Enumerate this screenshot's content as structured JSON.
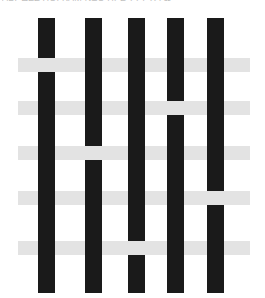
{
  "header": {
    "clipped_text": "ΑΒΓ ΔΕΖ ΗΘΙ ΚΛΜ ΝΞΟ ΠΡΣ ΤΥΦ ΧΨΩ"
  },
  "figure": {
    "background_color": "#ffffff",
    "warp_color": "#1a1a1a",
    "weft_color": "#e3e3e3",
    "warp_count": 5,
    "weft_count": 5,
    "warps": [
      {
        "id": "warp-1",
        "x": 38,
        "y": 18,
        "width": 17,
        "height": 275
      },
      {
        "id": "warp-2",
        "x": 85,
        "y": 18,
        "width": 17,
        "height": 275
      },
      {
        "id": "warp-3",
        "x": 128,
        "y": 18,
        "width": 17,
        "height": 275
      },
      {
        "id": "warp-4",
        "x": 167,
        "y": 18,
        "width": 17,
        "height": 275
      },
      {
        "id": "warp-5",
        "x": 207,
        "y": 18,
        "width": 17,
        "height": 275
      }
    ],
    "wefts": [
      {
        "id": "weft-1",
        "x": 18,
        "y": 58,
        "width": 232,
        "height": 14,
        "under_warp": 1
      },
      {
        "id": "weft-2",
        "x": 18,
        "y": 101,
        "width": 232,
        "height": 14,
        "under_warp": 4
      },
      {
        "id": "weft-3",
        "x": 18,
        "y": 146,
        "width": 232,
        "height": 14,
        "under_warp": 2
      },
      {
        "id": "weft-4",
        "x": 18,
        "y": 191,
        "width": 232,
        "height": 14,
        "under_warp": 5
      },
      {
        "id": "weft-5",
        "x": 18,
        "y": 241,
        "width": 232,
        "height": 14,
        "under_warp": 3
      }
    ]
  },
  "chart_data": {
    "type": "heatmap",
    "xlabel": "warp column",
    "ylabel": "weft row",
    "categories": [
      "warp-1",
      "warp-2",
      "warp-3",
      "warp-4",
      "warp-5"
    ],
    "row_labels": [
      "weft-1",
      "weft-2",
      "weft-3",
      "weft-4",
      "weft-5"
    ],
    "legend": [
      "over = warp on top (black)",
      "under = weft on top (gray)"
    ],
    "grid": false,
    "series": [
      {
        "name": "weft-1",
        "values": [
          "under",
          "over",
          "over",
          "over",
          "over"
        ]
      },
      {
        "name": "weft-2",
        "values": [
          "over",
          "over",
          "over",
          "under",
          "over"
        ]
      },
      {
        "name": "weft-3",
        "values": [
          "over",
          "under",
          "over",
          "over",
          "over"
        ]
      },
      {
        "name": "weft-4",
        "values": [
          "over",
          "over",
          "over",
          "over",
          "under"
        ]
      },
      {
        "name": "weft-5",
        "values": [
          "over",
          "over",
          "under",
          "over",
          "over"
        ]
      }
    ]
  }
}
